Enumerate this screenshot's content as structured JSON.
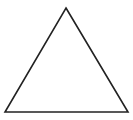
{
  "diagram": {
    "shape": "triangle",
    "vertices": [
      [
        66,
        8
      ],
      [
        128,
        112
      ],
      [
        5,
        112
      ]
    ],
    "stroke_color": "#222222",
    "stroke_width": 1.6,
    "fill_color": "#ffffff",
    "background_color": "#ffffff"
  }
}
